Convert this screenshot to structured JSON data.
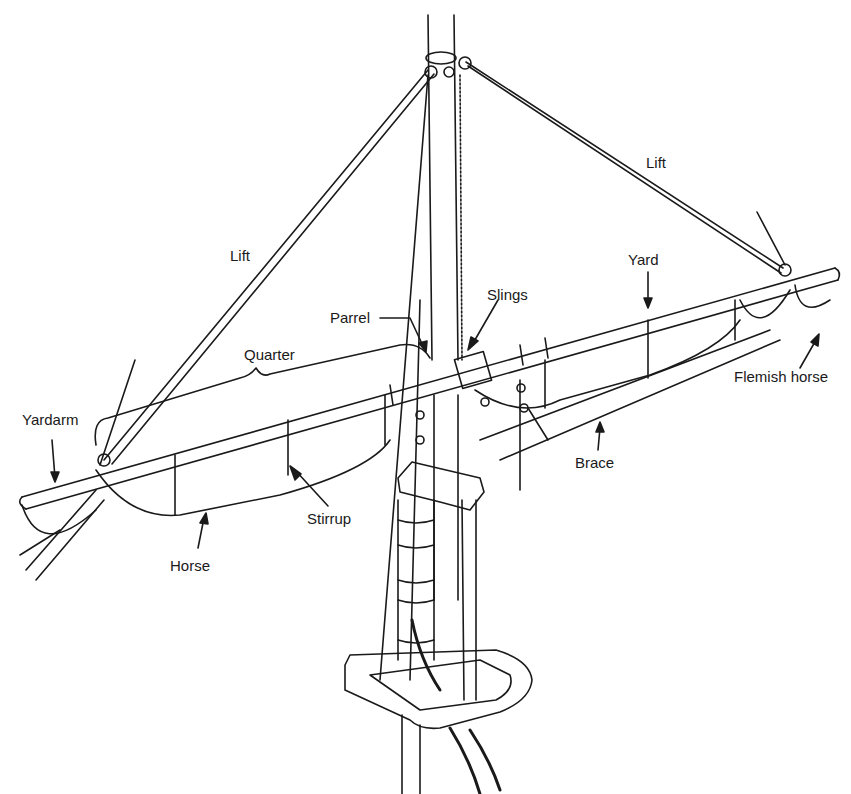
{
  "diagram": {
    "labels": [
      {
        "id": "lift-left",
        "text": "Lift",
        "x": 230,
        "y": 248
      },
      {
        "id": "lift-right",
        "text": "Lift",
        "x": 646,
        "y": 155
      },
      {
        "id": "yard",
        "text": "Yard",
        "x": 628,
        "y": 252
      },
      {
        "id": "slings",
        "text": "Slings",
        "x": 487,
        "y": 287
      },
      {
        "id": "parrel",
        "text": "Parrel",
        "x": 330,
        "y": 310
      },
      {
        "id": "quarter",
        "text": "Quarter",
        "x": 244,
        "y": 347
      },
      {
        "id": "yardarm",
        "text": "Yardarm",
        "x": 22,
        "y": 412
      },
      {
        "id": "flemish-horse",
        "text": "Flemish horse",
        "x": 734,
        "y": 369
      },
      {
        "id": "brace",
        "text": "Brace",
        "x": 575,
        "y": 455
      },
      {
        "id": "stirrup",
        "text": "Stirrup",
        "x": 307,
        "y": 511
      },
      {
        "id": "horse",
        "text": "Horse",
        "x": 170,
        "y": 558
      }
    ],
    "colors": {
      "line": "#1a1a1a",
      "background": "#ffffff"
    }
  }
}
